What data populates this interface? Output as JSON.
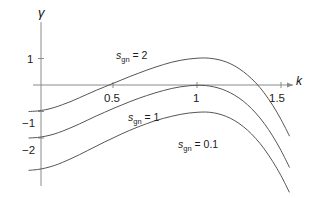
{
  "chart_data": {
    "type": "line",
    "title": "",
    "xlabel": "k",
    "ylabel": "γ",
    "xlim": [
      0,
      1.62
    ],
    "ylim": [
      -3.5,
      1.45
    ],
    "grid": false,
    "legend": "inline-curve-labels",
    "xticks": [
      {
        "value": 0.5,
        "label": "0.5"
      },
      {
        "value": 1,
        "label": "1"
      },
      {
        "value": 1.5,
        "label": "1.5"
      }
    ],
    "yticks": [
      {
        "value": 1,
        "label": "1"
      },
      {
        "value": -1,
        "label": "−1"
      },
      {
        "value": -2,
        "label": "−2"
      }
    ],
    "series": [
      {
        "name": "s_gn = 2",
        "label_var": "s",
        "label_sub": "gn",
        "label_eq": "= 2",
        "value": 2,
        "color": "#555555",
        "points": [
          [
            0.0,
            -1.0
          ],
          [
            0.05,
            -0.98
          ],
          [
            0.1,
            -0.93
          ],
          [
            0.15,
            -0.85
          ],
          [
            0.2,
            -0.74
          ],
          [
            0.25,
            -0.62
          ],
          [
            0.3,
            -0.48
          ],
          [
            0.35,
            -0.34
          ],
          [
            0.4,
            -0.2
          ],
          [
            0.45,
            -0.07
          ],
          [
            0.5,
            0.06
          ],
          [
            0.55,
            0.19
          ],
          [
            0.6,
            0.32
          ],
          [
            0.65,
            0.44
          ],
          [
            0.7,
            0.56
          ],
          [
            0.75,
            0.67
          ],
          [
            0.8,
            0.77
          ],
          [
            0.85,
            0.86
          ],
          [
            0.9,
            0.93
          ],
          [
            0.95,
            0.98
          ],
          [
            1.0,
            1.01
          ],
          [
            1.05,
            1.02
          ],
          [
            1.1,
            0.99
          ],
          [
            1.15,
            0.92
          ],
          [
            1.2,
            0.8
          ],
          [
            1.25,
            0.62
          ],
          [
            1.3,
            0.38
          ],
          [
            1.35,
            0.08
          ],
          [
            1.4,
            -0.3
          ],
          [
            1.45,
            -0.76
          ],
          [
            1.5,
            -1.3
          ],
          [
            1.55,
            -1.92
          ]
        ]
      },
      {
        "name": "s_gn = 1",
        "label_var": "s",
        "label_sub": "gn",
        "label_eq": "= 1",
        "value": 1,
        "color": "#555555",
        "points": [
          [
            0.0,
            -2.0
          ],
          [
            0.05,
            -1.98
          ],
          [
            0.1,
            -1.93
          ],
          [
            0.15,
            -1.85
          ],
          [
            0.2,
            -1.74
          ],
          [
            0.25,
            -1.61
          ],
          [
            0.3,
            -1.47
          ],
          [
            0.35,
            -1.32
          ],
          [
            0.4,
            -1.17
          ],
          [
            0.45,
            -1.03
          ],
          [
            0.5,
            -0.89
          ],
          [
            0.55,
            -0.76
          ],
          [
            0.6,
            -0.63
          ],
          [
            0.65,
            -0.51
          ],
          [
            0.7,
            -0.4
          ],
          [
            0.75,
            -0.3
          ],
          [
            0.8,
            -0.21
          ],
          [
            0.85,
            -0.13
          ],
          [
            0.9,
            -0.07
          ],
          [
            0.95,
            -0.03
          ],
          [
            1.0,
            -0.01
          ],
          [
            1.05,
            -0.02
          ],
          [
            1.1,
            -0.07
          ],
          [
            1.15,
            -0.16
          ],
          [
            1.2,
            -0.3
          ],
          [
            1.25,
            -0.49
          ],
          [
            1.3,
            -0.74
          ],
          [
            1.35,
            -1.06
          ],
          [
            1.4,
            -1.45
          ],
          [
            1.45,
            -1.92
          ],
          [
            1.5,
            -2.47
          ],
          [
            1.55,
            -3.1
          ]
        ]
      },
      {
        "name": "s_gn = 0.1",
        "label_var": "s",
        "label_sub": "gn",
        "label_eq": "= 0.1",
        "value": 0.1,
        "color": "#555555",
        "points": [
          [
            0.0,
            -3.22
          ],
          [
            0.05,
            -3.19
          ],
          [
            0.1,
            -3.13
          ],
          [
            0.15,
            -3.04
          ],
          [
            0.2,
            -2.92
          ],
          [
            0.25,
            -2.78
          ],
          [
            0.3,
            -2.63
          ],
          [
            0.35,
            -2.47
          ],
          [
            0.4,
            -2.31
          ],
          [
            0.45,
            -2.15
          ],
          [
            0.5,
            -2.0
          ],
          [
            0.55,
            -1.85
          ],
          [
            0.6,
            -1.71
          ],
          [
            0.65,
            -1.58
          ],
          [
            0.7,
            -1.46
          ],
          [
            0.75,
            -1.35
          ],
          [
            0.8,
            -1.26
          ],
          [
            0.85,
            -1.18
          ],
          [
            0.9,
            -1.11
          ],
          [
            0.95,
            -1.06
          ],
          [
            1.0,
            -1.03
          ],
          [
            1.05,
            -1.02
          ],
          [
            1.1,
            -1.05
          ],
          [
            1.15,
            -1.13
          ],
          [
            1.2,
            -1.26
          ],
          [
            1.25,
            -1.45
          ],
          [
            1.3,
            -1.7
          ],
          [
            1.35,
            -2.02
          ],
          [
            1.4,
            -2.41
          ],
          [
            1.45,
            -2.88
          ],
          [
            1.5,
            -3.42
          ],
          [
            1.55,
            -4.05
          ]
        ]
      }
    ]
  }
}
